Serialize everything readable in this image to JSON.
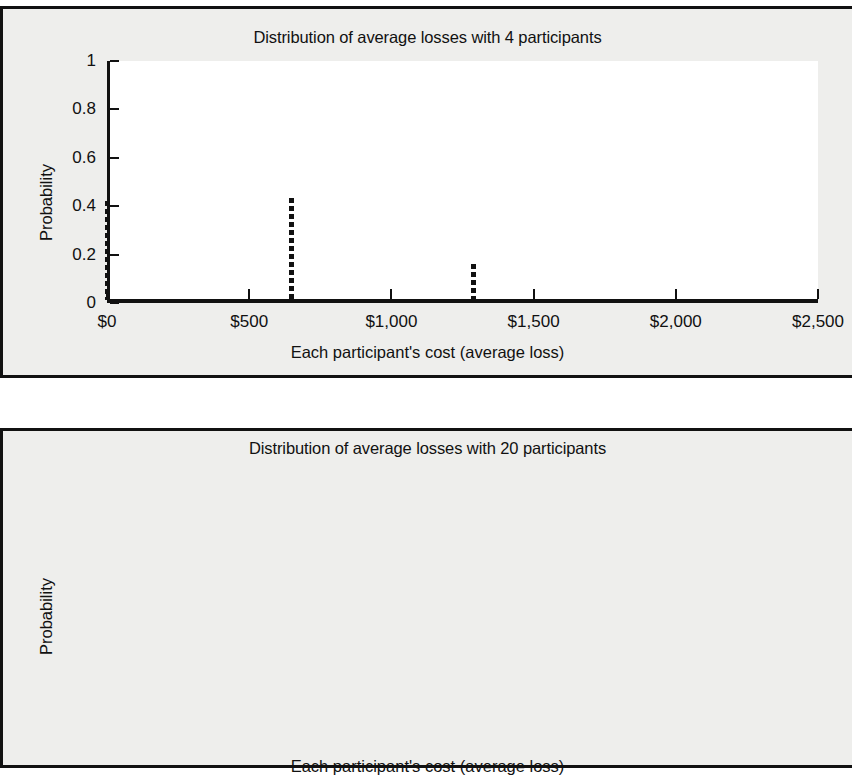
{
  "figures": [
    {
      "id": "figure-1",
      "title": "Distribution of average losses with 4 participants",
      "xlabel": "Each participant's cost (average loss)",
      "ylabel": "Probability"
    },
    {
      "id": "figure-2",
      "title": "Distribution of average losses with 20 participants",
      "xlabel": "Each participant's cost (average loss)",
      "ylabel": "Probability"
    }
  ],
  "axes": {
    "y_ticks": [
      "0",
      "0.2",
      "0.4",
      "0.6",
      "0.8",
      "1"
    ],
    "y_tick_values": [
      0,
      0.2,
      0.4,
      0.6,
      0.8,
      1
    ],
    "x_ticks": [
      "$0",
      "$500",
      "$1,000",
      "$1,500",
      "$2,000",
      "$2,500"
    ],
    "x_tick_values": [
      0,
      500,
      1000,
      1500,
      2000,
      2500
    ]
  },
  "colors": {
    "page_background": "#ffffff",
    "panel_background": "#eeeeec",
    "plot_background": "#ffffff",
    "ink": "#111111"
  },
  "chart_data": [
    {
      "type": "bar",
      "title": "Distribution of average losses with 4 participants",
      "subtitle": "",
      "xlabel": "Each participant's cost (average loss)",
      "ylabel": "Probability",
      "xlim": [
        0,
        2500
      ],
      "ylim": [
        0,
        1
      ],
      "grid": false,
      "legend": null,
      "style": "dashed vertical stems",
      "x": [
        0,
        650,
        1290
      ],
      "values": [
        0.41,
        0.42,
        0.15
      ],
      "points": [
        {
          "x": 0,
          "y": 0.41
        },
        {
          "x": 650,
          "y": 0.42
        },
        {
          "x": 1290,
          "y": 0.15
        }
      ]
    },
    {
      "type": "bar",
      "title": "Distribution of average losses with 20 participants",
      "subtitle": "",
      "xlabel": "Each participant's cost (average loss)",
      "ylabel": "Probability",
      "xlim": [
        0,
        2500
      ],
      "ylim": [
        0,
        1
      ],
      "grid": false,
      "legend": null,
      "style": "dotted vertical stems",
      "x": [
        25,
        130,
        255,
        385,
        510,
        640,
        770,
        895,
        1025,
        1150
      ],
      "values": [
        0.03,
        0.055,
        0.14,
        0.21,
        0.23,
        0.165,
        0.1,
        0.06,
        0.025,
        0.008
      ],
      "points": [
        {
          "x": 25,
          "y": 0.03
        },
        {
          "x": 130,
          "y": 0.055
        },
        {
          "x": 255,
          "y": 0.14
        },
        {
          "x": 385,
          "y": 0.21
        },
        {
          "x": 510,
          "y": 0.23
        },
        {
          "x": 640,
          "y": 0.165
        },
        {
          "x": 770,
          "y": 0.1
        },
        {
          "x": 895,
          "y": 0.06
        },
        {
          "x": 1025,
          "y": 0.025
        },
        {
          "x": 1150,
          "y": 0.008
        }
      ]
    }
  ]
}
